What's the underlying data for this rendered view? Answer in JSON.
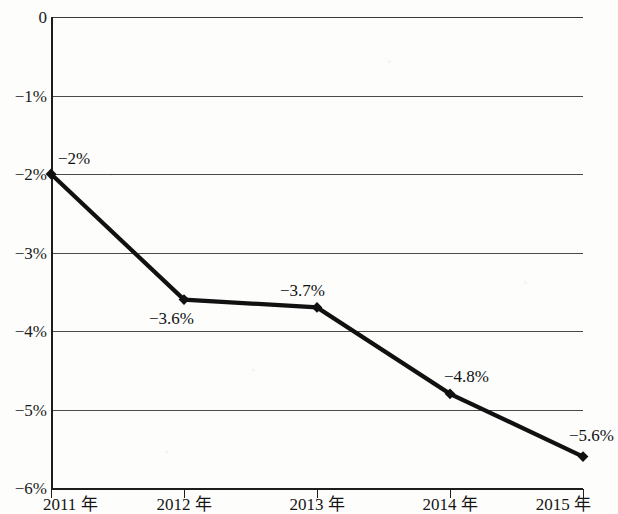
{
  "chart_data": {
    "type": "line",
    "title": "",
    "xlabel": "",
    "ylabel": "",
    "categories": [
      "2011 年",
      "2012 年",
      "2013 年",
      "2014 年",
      "2015 年"
    ],
    "values": [
      -2.0,
      -3.6,
      -3.7,
      -4.8,
      -5.6
    ],
    "point_labels": [
      "−2%",
      "−3.6%",
      "−3.7%",
      "−4.8%",
      "−5.6%"
    ],
    "series": [
      {
        "name": "",
        "values": [
          -2.0,
          -3.6,
          -3.7,
          -4.8,
          -5.6
        ]
      }
    ],
    "ylim": [
      -6,
      0
    ],
    "ytick_values": [
      0,
      -1,
      -2,
      -3,
      -4,
      -5,
      -6
    ],
    "ytick_labels": [
      "0",
      "−1%",
      "−2%",
      "−3%",
      "−4%",
      "−5%",
      "−6%"
    ],
    "grid": true,
    "legend": null,
    "line_color": "#111111",
    "marker": "diamond",
    "marker_color": "#111111"
  },
  "axes": {
    "y_axis_name": "percent-axis",
    "x_axis_name": "year-axis"
  }
}
